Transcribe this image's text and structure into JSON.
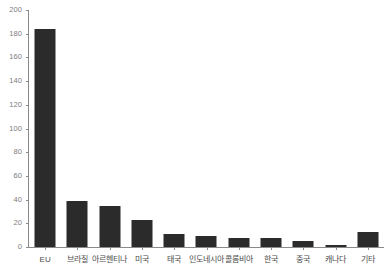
{
  "chart_data": {
    "type": "bar",
    "title": "",
    "subtitle": "",
    "xlabel": "",
    "ylabel": "",
    "ylim": [
      0,
      200
    ],
    "yticks": [
      0,
      20,
      40,
      60,
      80,
      100,
      120,
      140,
      160,
      180,
      200
    ],
    "grid": false,
    "legend": null,
    "bar_color": "#2b2b2b",
    "axis_color": "#8a8a8a",
    "label_color": "#4a4a4a",
    "tick_label_color": "#7d7d7d",
    "categories": [
      "EU",
      "브라질",
      "아르헨티나",
      "미국",
      "태국",
      "인도네시아",
      "콜롬비아",
      "한국",
      "중국",
      "캐나다",
      "기타"
    ],
    "values": [
      184,
      39,
      35,
      23,
      11,
      9,
      8,
      8,
      5,
      2,
      13
    ]
  }
}
